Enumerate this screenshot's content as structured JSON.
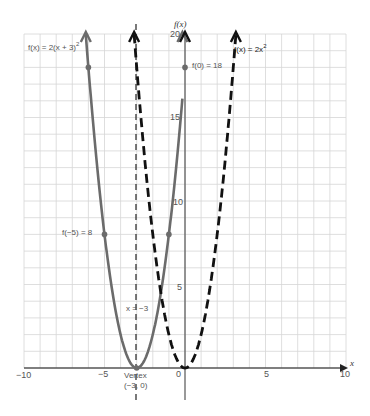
{
  "chart_data": {
    "type": "line",
    "title": "",
    "xlabel": "x",
    "ylabel": "f(x)",
    "xlim": [
      -10,
      10
    ],
    "ylim": [
      0,
      20
    ],
    "grid": true,
    "x_ticks": [
      -10,
      -5,
      0,
      5,
      10
    ],
    "y_ticks": [
      5,
      10,
      15,
      20
    ],
    "series": [
      {
        "name": "f(x) = 2(x + 3)^2",
        "style": "solid",
        "color": "#6b6b6b",
        "x": [
          -6.16,
          -6,
          -5,
          -4,
          -3,
          -2,
          -1,
          -0.16
        ],
        "values": [
          20,
          18,
          8,
          2,
          0,
          2,
          8,
          20
        ]
      },
      {
        "name": "f(x) = 2x^2",
        "style": "dashed",
        "color": "#111111",
        "x": [
          -3.16,
          -3,
          -2,
          -1,
          0,
          1,
          2,
          3,
          3.16
        ],
        "values": [
          20,
          18,
          8,
          2,
          0,
          2,
          8,
          18,
          20
        ]
      }
    ],
    "annotations": [
      {
        "text": "f(x) = 2(x + 3)²",
        "x": -7.5,
        "y": 19
      },
      {
        "text": "f(x) = 2x²",
        "x": 5.5,
        "y": 19
      },
      {
        "text": "f(0) = 18",
        "x": 0,
        "y": 18
      },
      {
        "text": "f(−5) = 8",
        "x": -5,
        "y": 8
      },
      {
        "text": "x = −3",
        "x": -3,
        "y": 3
      },
      {
        "text": "Vertex",
        "x": -3,
        "y": -0.8
      },
      {
        "text": "(−3, 0)",
        "x": -3,
        "y": -1.6
      }
    ],
    "points": [
      {
        "x": -6,
        "y": 18
      },
      {
        "x": 0,
        "y": 18
      },
      {
        "x": -5,
        "y": 8
      },
      {
        "x": -1,
        "y": 8
      },
      {
        "x": -3,
        "y": 0
      }
    ],
    "axis_of_symmetry": {
      "x": -3,
      "label": "x = −3"
    }
  },
  "labels": {
    "series1": "f(x) = 2(x + 3)",
    "series1_exp": "2",
    "series2": "f(x) = 2x",
    "series2_exp": "2",
    "f0": "f(0) = 18",
    "fm5": "f(−5) = 8",
    "sym": "x = −3",
    "vertex": "Vertex",
    "vertex_coord": "(−3, 0)",
    "xaxis": "x",
    "yaxis": "f(x)",
    "xt_m10": "−10",
    "xt_m5": "−5",
    "xt_0": "0",
    "xt_5": "5",
    "xt_10": "10",
    "yt_5": "5",
    "yt_10": "10",
    "yt_15": "15",
    "yt_20": "20"
  }
}
